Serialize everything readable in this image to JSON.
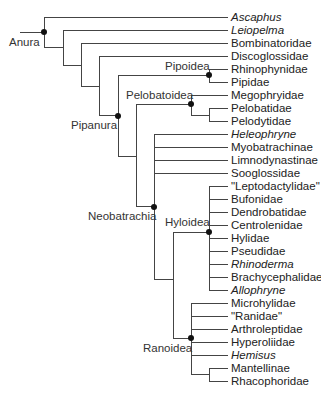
{
  "diagram": {
    "type": "phylogenetic-tree",
    "root_label": "Anura",
    "leaves": [
      {
        "name": "Ascaphus",
        "italic": true
      },
      {
        "name": "Leiopelma",
        "italic": true
      },
      {
        "name": "Bombinatoridae",
        "italic": false
      },
      {
        "name": "Discoglossidae",
        "italic": false
      },
      {
        "name": "Rhinophynidae",
        "italic": false
      },
      {
        "name": "Pipidae",
        "italic": false
      },
      {
        "name": "Megophryidae",
        "italic": false
      },
      {
        "name": "Pelobatidae",
        "italic": false
      },
      {
        "name": "Pelodytidae",
        "italic": false
      },
      {
        "name": "Heleophryne",
        "italic": true
      },
      {
        "name": "Myobatrachinae",
        "italic": false
      },
      {
        "name": "Limnodynastinae",
        "italic": false
      },
      {
        "name": "Sooglossidae",
        "italic": false
      },
      {
        "name": "\"Leptodactylidae\"",
        "italic": false
      },
      {
        "name": "Bufonidae",
        "italic": false
      },
      {
        "name": "Dendrobatidae",
        "italic": false
      },
      {
        "name": "Centrolenidae",
        "italic": false
      },
      {
        "name": "Hylidae",
        "italic": false
      },
      {
        "name": "Pseudidae",
        "italic": false
      },
      {
        "name": "Rhinoderma",
        "italic": true
      },
      {
        "name": "Brachycephalidae",
        "italic": false
      },
      {
        "name": "Allophryne",
        "italic": true
      },
      {
        "name": "Microhylidae",
        "italic": false
      },
      {
        "name": "\"Ranidae\"",
        "italic": false
      },
      {
        "name": "Arthroleptidae",
        "italic": false
      },
      {
        "name": "Hyperoliidae",
        "italic": false
      },
      {
        "name": "Hemisus",
        "italic": true
      },
      {
        "name": "Mantellinae",
        "italic": false
      },
      {
        "name": "Rhacophoridae",
        "italic": false
      }
    ],
    "clades": {
      "anura": "Anura",
      "pipanura": "Pipanura",
      "pipoidea": "Pipoidea",
      "pelobatoidea": "Pelobatoidea",
      "neobatrachia": "Neobatrachia",
      "hyloidea": "Hyloidea",
      "ranoidea": "Ranoidea"
    },
    "colors": {
      "line": "#444444",
      "node": "#111111",
      "text": "#222222"
    }
  }
}
